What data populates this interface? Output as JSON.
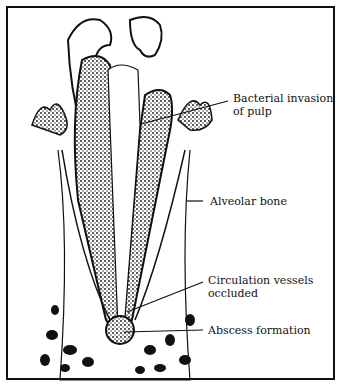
{
  "diagram": {
    "labels": [
      {
        "id": "bacterial",
        "line1": "Bacterial invasion",
        "line2": "of pulp"
      },
      {
        "id": "alveolar",
        "line1": "Alveolar bone"
      },
      {
        "id": "circulation",
        "line1": "Circulation vessels",
        "line2": "occluded"
      },
      {
        "id": "abscess",
        "line1": "Abscess formation"
      }
    ],
    "colors": {
      "ink": "#111111",
      "background": "#ffffff"
    }
  }
}
